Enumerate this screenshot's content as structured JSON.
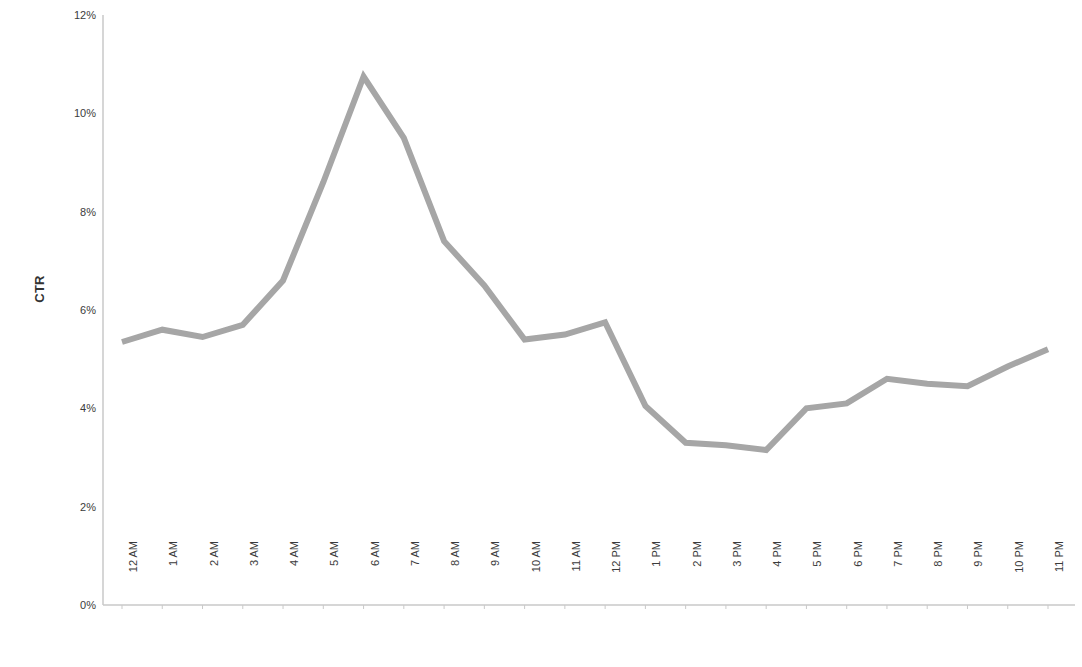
{
  "chart_data": {
    "type": "line",
    "title": "",
    "xlabel": "",
    "ylabel": "CTR",
    "ylim": [
      0,
      12
    ],
    "ytick_labels": [
      "0%",
      "2%",
      "4%",
      "6%",
      "8%",
      "10%",
      "12%"
    ],
    "ytick_values": [
      0,
      2,
      4,
      6,
      8,
      10,
      12
    ],
    "yaxis_unit": "%",
    "grid": false,
    "legend": "none",
    "line_color": "#a6a6a6",
    "line_width": 6,
    "categories": [
      "12 AM",
      "1 AM",
      "2 AM",
      "3 AM",
      "4 AM",
      "5 AM",
      "6 AM",
      "7 AM",
      "8 AM",
      "9 AM",
      "10 AM",
      "11 AM",
      "12 PM",
      "1 PM",
      "2 PM",
      "3 PM",
      "4 PM",
      "5 PM",
      "6 PM",
      "7 PM",
      "8 PM",
      "9 PM",
      "10 PM",
      "11 PM"
    ],
    "values": [
      5.35,
      5.6,
      5.45,
      5.7,
      6.6,
      8.6,
      10.75,
      9.5,
      7.4,
      6.5,
      5.4,
      5.5,
      5.75,
      4.05,
      3.3,
      3.25,
      3.15,
      4.0,
      4.1,
      4.6,
      4.5,
      4.45,
      4.85,
      5.2
    ],
    "series_name": "CTR"
  },
  "axes": {
    "y_title": "CTR"
  }
}
